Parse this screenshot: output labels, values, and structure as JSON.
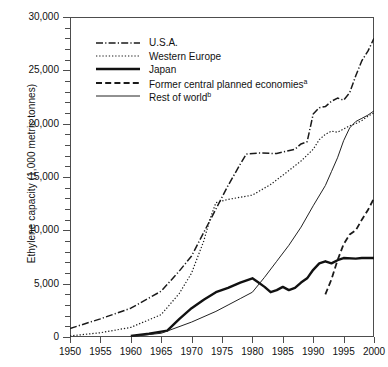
{
  "chart_data": {
    "type": "line",
    "title": "",
    "xlabel": "",
    "ylabel": "Ethylene capacity (1,000 metric tonnes)",
    "xlim": [
      1950,
      2000
    ],
    "ylim": [
      0,
      30000
    ],
    "grid": false,
    "legend_position": "upper-left-inside",
    "x_ticks": [
      "1950",
      "1955",
      "1960",
      "1965",
      "1970",
      "1975",
      "1980",
      "1985",
      "1990",
      "1995",
      "2000"
    ],
    "x_tick_values": [
      1950,
      1955,
      1960,
      1965,
      1970,
      1975,
      1980,
      1985,
      1990,
      1995,
      2000
    ],
    "y_ticks": [
      "0",
      "5,000",
      "10,000",
      "15,000",
      "20,000",
      "25,000",
      "30,000"
    ],
    "y_tick_values": [
      0,
      5000,
      10000,
      15000,
      20000,
      25000,
      30000
    ],
    "y_minor_tick_interval": 1000,
    "series": [
      {
        "name": "U.S.A.",
        "style": "dash-dot",
        "color": "#1a1a1a",
        "width": 1.5,
        "points": [
          [
            1950,
            800
          ],
          [
            1955,
            1700
          ],
          [
            1960,
            2700
          ],
          [
            1965,
            4300
          ],
          [
            1968,
            6200
          ],
          [
            1970,
            7600
          ],
          [
            1972,
            9800
          ],
          [
            1974,
            12000
          ],
          [
            1976,
            14200
          ],
          [
            1978,
            16200
          ],
          [
            1979,
            17150
          ],
          [
            1981,
            17250
          ],
          [
            1984,
            17200
          ],
          [
            1987,
            17600
          ],
          [
            1988,
            18100
          ],
          [
            1989,
            18300
          ],
          [
            1990,
            20900
          ],
          [
            1991,
            21500
          ],
          [
            1992,
            21600
          ],
          [
            1993,
            22100
          ],
          [
            1994,
            22400
          ],
          [
            1995,
            22200
          ],
          [
            1996,
            22900
          ],
          [
            1997,
            24500
          ],
          [
            1998,
            25900
          ],
          [
            1999,
            26800
          ],
          [
            2000,
            28000
          ]
        ]
      },
      {
        "name": "Western Europe",
        "style": "dotted",
        "color": "#1a1a1a",
        "width": 1.2,
        "points": [
          [
            1950,
            100
          ],
          [
            1955,
            400
          ],
          [
            1960,
            900
          ],
          [
            1965,
            2100
          ],
          [
            1968,
            4100
          ],
          [
            1970,
            6000
          ],
          [
            1972,
            9000
          ],
          [
            1973,
            11000
          ],
          [
            1974,
            12600
          ],
          [
            1976,
            12900
          ],
          [
            1978,
            13100
          ],
          [
            1980,
            13300
          ],
          [
            1983,
            14300
          ],
          [
            1986,
            15600
          ],
          [
            1988,
            16500
          ],
          [
            1990,
            17600
          ],
          [
            1991,
            18500
          ],
          [
            1992,
            19000
          ],
          [
            1993,
            19300
          ],
          [
            1994,
            19200
          ],
          [
            1995,
            19500
          ],
          [
            1996,
            19800
          ],
          [
            1997,
            20000
          ],
          [
            1998,
            20300
          ],
          [
            1999,
            20700
          ],
          [
            2000,
            21000
          ]
        ]
      },
      {
        "name": "Japan",
        "style": "solid-thick",
        "color": "#111111",
        "width": 2.4,
        "points": [
          [
            1960,
            100
          ],
          [
            1963,
            300
          ],
          [
            1965,
            500
          ],
          [
            1966,
            600
          ],
          [
            1968,
            1700
          ],
          [
            1970,
            2700
          ],
          [
            1972,
            3500
          ],
          [
            1974,
            4200
          ],
          [
            1976,
            4600
          ],
          [
            1978,
            5100
          ],
          [
            1980,
            5500
          ],
          [
            1981,
            5100
          ],
          [
            1982,
            4700
          ],
          [
            1983,
            4200
          ],
          [
            1984,
            4400
          ],
          [
            1985,
            4700
          ],
          [
            1986,
            4400
          ],
          [
            1987,
            4600
          ],
          [
            1988,
            5100
          ],
          [
            1989,
            5500
          ],
          [
            1990,
            6300
          ],
          [
            1991,
            6900
          ],
          [
            1992,
            7100
          ],
          [
            1993,
            6900
          ],
          [
            1994,
            7200
          ],
          [
            1995,
            7400
          ],
          [
            1997,
            7350
          ],
          [
            1998,
            7400
          ],
          [
            2000,
            7400
          ]
        ]
      },
      {
        "name": "Former central planned economies",
        "footnote": "a",
        "style": "dashed",
        "color": "#1a1a1a",
        "width": 1.8,
        "points": [
          [
            1992,
            4000
          ],
          [
            1993,
            5400
          ],
          [
            1994,
            7200
          ],
          [
            1995,
            8700
          ],
          [
            1996,
            9600
          ],
          [
            1997,
            10000
          ],
          [
            1998,
            11000
          ],
          [
            1999,
            11900
          ],
          [
            2000,
            13000
          ]
        ]
      },
      {
        "name": "Rest of world",
        "footnote": "b",
        "style": "solid-thin",
        "color": "#222222",
        "width": 1.0,
        "points": [
          [
            1960,
            50
          ],
          [
            1965,
            350
          ],
          [
            1970,
            1400
          ],
          [
            1974,
            2400
          ],
          [
            1976,
            3000
          ],
          [
            1978,
            3600
          ],
          [
            1980,
            4200
          ],
          [
            1982,
            5600
          ],
          [
            1984,
            7100
          ],
          [
            1986,
            8600
          ],
          [
            1988,
            10300
          ],
          [
            1990,
            12300
          ],
          [
            1992,
            14200
          ],
          [
            1993,
            15500
          ],
          [
            1994,
            16800
          ],
          [
            1995,
            18400
          ],
          [
            1996,
            19600
          ],
          [
            1997,
            20200
          ],
          [
            1998,
            20500
          ],
          [
            1999,
            20800
          ],
          [
            2000,
            21200
          ]
        ]
      }
    ]
  },
  "axes": {
    "y_title": "Ethylene capacity (1,000 metric tonnes)"
  },
  "legend": {
    "items": [
      {
        "label": "U.S.A.",
        "footnote": "",
        "key": "dash-dot-key"
      },
      {
        "label": "Western Europe",
        "footnote": "",
        "key": "dotted-key"
      },
      {
        "label": "Japan",
        "footnote": "",
        "key": "solid-thick-key"
      },
      {
        "label": "Former central planned economies",
        "footnote": "a",
        "key": "dashed-key"
      },
      {
        "label": "Rest of world",
        "footnote": "b",
        "key": "solid-thin-key"
      }
    ]
  },
  "colors": {
    "ink": "#111111",
    "axis": "#4d4d4d",
    "background": "#ffffff"
  }
}
